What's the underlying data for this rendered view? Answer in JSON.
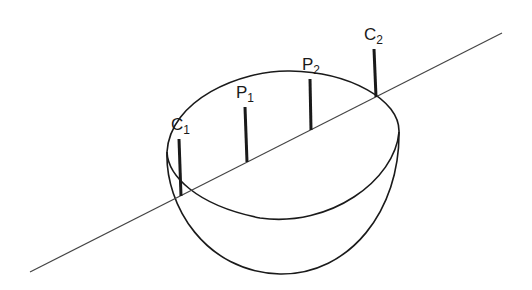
{
  "diagram": {
    "labels": [
      {
        "id": "C1",
        "main": "C",
        "sub": "1"
      },
      {
        "id": "P1",
        "main": "P",
        "sub": "1"
      },
      {
        "id": "P2",
        "main": "P",
        "sub": "2"
      },
      {
        "id": "C2",
        "main": "C",
        "sub": "2"
      }
    ],
    "colors": {
      "stroke": "#1a1a1a",
      "line": "#444444",
      "background": "#ffffff"
    }
  }
}
